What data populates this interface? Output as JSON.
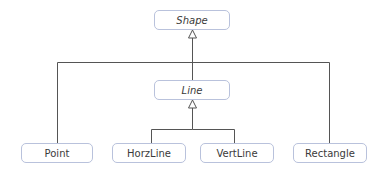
{
  "diagram": {
    "type": "uml-class-hierarchy",
    "colors": {
      "node_border": "#b9c2dc",
      "edge": "#555555",
      "text": "#3a3a3a",
      "background": "#ffffff"
    },
    "nodes": [
      {
        "id": "shape",
        "label": "Shape",
        "abstract": true,
        "x": 154,
        "y": 10,
        "w": 76,
        "h": 20
      },
      {
        "id": "line",
        "label": "Line",
        "abstract": true,
        "x": 154,
        "y": 80,
        "w": 76,
        "h": 20
      },
      {
        "id": "point",
        "label": "Point",
        "abstract": false,
        "x": 21,
        "y": 143,
        "w": 72,
        "h": 20
      },
      {
        "id": "horzline",
        "label": "HorzLine",
        "abstract": false,
        "x": 112,
        "y": 143,
        "w": 74,
        "h": 20
      },
      {
        "id": "vertline",
        "label": "VertLine",
        "abstract": false,
        "x": 200,
        "y": 143,
        "w": 74,
        "h": 20
      },
      {
        "id": "rectangle",
        "label": "Rectangle",
        "abstract": false,
        "x": 293,
        "y": 143,
        "w": 74,
        "h": 20
      }
    ],
    "edges": [
      {
        "from": "line",
        "to": "shape",
        "kind": "generalization"
      },
      {
        "from": "point",
        "to": "shape",
        "kind": "generalization"
      },
      {
        "from": "rectangle",
        "to": "shape",
        "kind": "generalization"
      },
      {
        "from": "horzline",
        "to": "line",
        "kind": "generalization"
      },
      {
        "from": "vertline",
        "to": "line",
        "kind": "generalization"
      }
    ]
  }
}
